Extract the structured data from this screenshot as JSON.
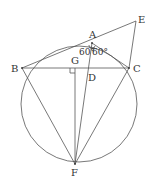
{
  "diagram": {
    "type": "geometry",
    "colors": {
      "stroke": "#555555",
      "text": "#333333",
      "background": "#ffffff"
    },
    "circle": {
      "cx": 79,
      "cy": 104,
      "r": 58
    },
    "points": {
      "A": {
        "label": "A",
        "x": 92,
        "y": 43
      },
      "B": {
        "label": "B",
        "x": 22,
        "y": 68
      },
      "C": {
        "label": "C",
        "x": 129,
        "y": 68
      },
      "D": {
        "label": "D",
        "x": 88,
        "y": 68
      },
      "E": {
        "label": "E",
        "x": 136,
        "y": 21
      },
      "F": {
        "label": "F",
        "x": 75,
        "y": 164
      },
      "G": {
        "label": "G",
        "x": 75,
        "y": 68
      }
    },
    "segments": [
      "BE",
      "AE",
      "EC",
      "BC",
      "AC",
      "BF",
      "CF",
      "AF",
      "GF"
    ],
    "angles": [
      {
        "label": "60°",
        "at": "A",
        "between": [
          "B",
          "D"
        ]
      },
      {
        "label": "60°",
        "at": "A",
        "between": [
          "D",
          "C"
        ]
      }
    ],
    "right_angle": {
      "at": "G",
      "between": [
        "B",
        "F"
      ]
    }
  }
}
